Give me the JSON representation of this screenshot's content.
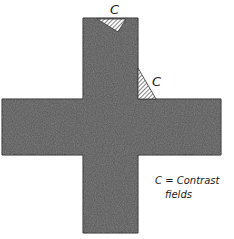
{
  "diagram": {
    "shape": "cross",
    "fill_color": "#5a5a5a",
    "outline_color": "#2a2a2a",
    "hatch_color": "#333333",
    "contrast_labels": [
      "C",
      "C"
    ],
    "legend": {
      "line1": "C = Contrast",
      "line2": "fields"
    }
  }
}
